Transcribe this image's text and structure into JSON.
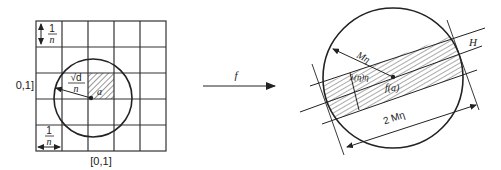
{
  "left_panel": {
    "grid_cells": 5,
    "vertical_axis_label": "0,1]",
    "horizontal_axis_label": "[0,1]",
    "cell_size_label_top": {
      "num": "1",
      "den": "n"
    },
    "cell_size_label_bottom": {
      "num": "1",
      "den": "n"
    },
    "radius_label": {
      "num": "√d",
      "den": "n"
    },
    "point_label": "a"
  },
  "mapping": {
    "arrow_label": "f"
  },
  "right_panel": {
    "radius_label": "Mη",
    "band_width_label": "λ(η)η",
    "point_label": "f(a)",
    "hyperplane_label": "H",
    "diameter_label": "2 Mη"
  },
  "colors": {
    "stroke": "#222222",
    "grid": "#333333",
    "background": "#ffffff"
  }
}
